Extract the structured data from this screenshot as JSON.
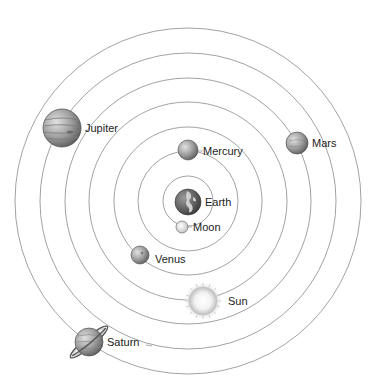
{
  "diagram": {
    "center": {
      "x": 188,
      "y": 201
    },
    "orbit_radii": [
      25,
      50,
      74,
      99,
      123,
      148,
      173
    ],
    "colors": {
      "orbit": "#8a8a8a",
      "label": "#222222",
      "background": "#ffffff"
    }
  },
  "bodies": [
    {
      "name": "Earth",
      "label": "Earth",
      "x": 188,
      "y": 202,
      "r": 13,
      "label_x": 205,
      "label_y": 206,
      "orbit_index": null
    },
    {
      "name": "Moon",
      "label": "Moon",
      "x": 182,
      "y": 227,
      "r": 6,
      "label_x": 193,
      "label_y": 231,
      "orbit_index": 0
    },
    {
      "name": "Mercury",
      "label": "Mercury",
      "x": 188,
      "y": 150,
      "r": 10,
      "label_x": 203,
      "label_y": 155,
      "orbit_index": 1
    },
    {
      "name": "Venus",
      "label": "Venus",
      "x": 140,
      "y": 255,
      "r": 9,
      "label_x": 155,
      "label_y": 263,
      "orbit_index": 2
    },
    {
      "name": "Sun",
      "label": "Sun",
      "x": 203,
      "y": 301,
      "r": 15,
      "label_x": 228,
      "label_y": 305,
      "orbit_index": 3
    },
    {
      "name": "Mars",
      "label": "Mars",
      "x": 297,
      "y": 143,
      "r": 11,
      "label_x": 312,
      "label_y": 147,
      "orbit_index": 4
    },
    {
      "name": "Jupiter",
      "label": "Jupiter",
      "x": 62,
      "y": 128,
      "r": 19,
      "label_x": 85,
      "label_y": 132,
      "orbit_index": 5
    },
    {
      "name": "Saturn",
      "label": "Saturn",
      "x": 89,
      "y": 342,
      "r": 14,
      "label_x": 107,
      "label_y": 346,
      "orbit_index": 6
    }
  ]
}
